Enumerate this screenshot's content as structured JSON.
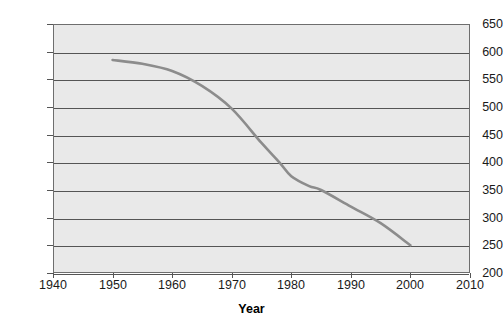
{
  "chart_data": {
    "type": "line",
    "title": "",
    "xlabel": "Year",
    "ylabel": "",
    "xlim": [
      1940,
      2010
    ],
    "ylim": [
      200,
      650
    ],
    "grid": true,
    "legend": "none",
    "x_ticks": [
      "1940",
      "1950",
      "1960",
      "1970",
      "1980",
      "1990",
      "2000",
      "2010"
    ],
    "y_ticks": [
      "200",
      "250",
      "300",
      "350",
      "400",
      "450",
      "500",
      "550",
      "600",
      "650"
    ],
    "line_color": "#8c8c8c",
    "plot_background": "#e9e9e9",
    "series": [
      {
        "name": "series-1",
        "x": [
          1950,
          1955,
          1960,
          1965,
          1970,
          1975,
          1978,
          1980,
          1983,
          1985,
          1990,
          1995,
          2000
        ],
        "values": [
          585,
          578,
          565,
          538,
          497,
          435,
          400,
          375,
          357,
          350,
          320,
          290,
          250
        ]
      }
    ]
  },
  "axes": {
    "x_title": "Year",
    "x_tick_labels": [
      "1940",
      "1950",
      "1960",
      "1970",
      "1980",
      "1990",
      "2000",
      "2010"
    ],
    "y_tick_labels": [
      "650",
      "600",
      "550",
      "500",
      "450",
      "400",
      "350",
      "300",
      "250",
      "200"
    ]
  }
}
